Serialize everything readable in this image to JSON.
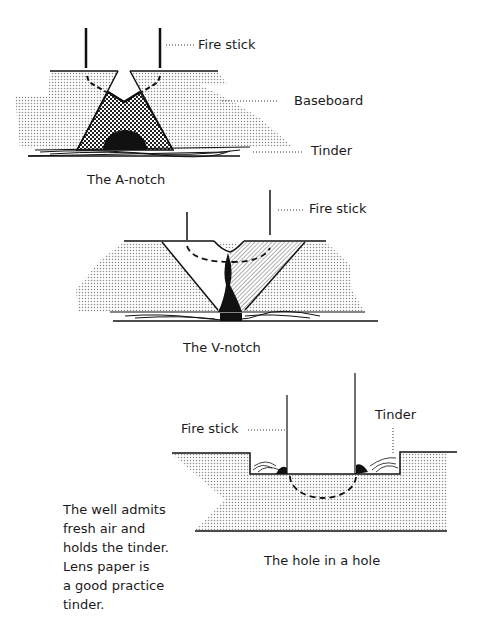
{
  "diagrams": {
    "a_notch": {
      "caption": "The A-notch",
      "labels": {
        "fire_stick": "Fire stick",
        "baseboard": "Baseboard",
        "tinder": "Tinder"
      }
    },
    "v_notch": {
      "caption": "The V-notch",
      "labels": {
        "fire_stick": "Fire stick"
      }
    },
    "hole_in_hole": {
      "caption": "The hole in a hole",
      "labels": {
        "fire_stick": "Fire stick",
        "tinder": "Tinder"
      }
    }
  },
  "note": {
    "lines": [
      "The well admits",
      "fresh air and",
      "holds the tinder.",
      "Lens paper is",
      "a good practice",
      "tinder."
    ]
  }
}
